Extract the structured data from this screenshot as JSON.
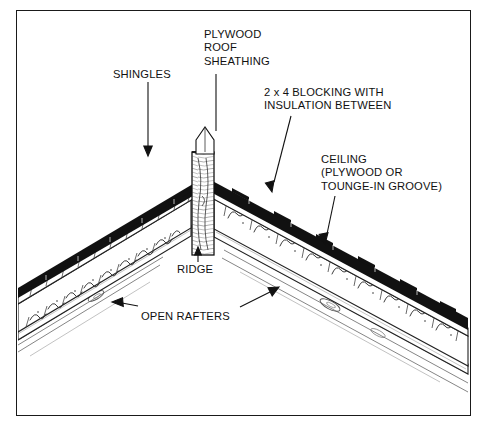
{
  "diagram": {
    "type": "architectural-cross-section",
    "background_color": "#ffffff",
    "ink_color": "#111111",
    "border": {
      "name": "diagram-frame",
      "color": "#1a1a1a",
      "x": 16,
      "y": 10,
      "width": 455,
      "height": 406
    }
  },
  "labels": [
    {
      "id": "shingles",
      "lines": [
        "SHINGLES"
      ],
      "x": 113,
      "y": 68,
      "leader": {
        "type": "vertical-arrow-down",
        "x1": 148,
        "y1": 82,
        "x2": 148,
        "y2": 152
      }
    },
    {
      "id": "plywood-roof-sheathing",
      "lines": [
        "PLYWOOD",
        "ROOF",
        "SHEATHING"
      ],
      "x": 204,
      "y": 28,
      "leader": {
        "type": "vertical-line",
        "x1": 216,
        "y1": 74,
        "x2": 216,
        "y2": 131
      }
    },
    {
      "id": "blocking-insulation",
      "lines": [
        "2 x 4 BLOCKING WITH",
        "INSULATION BETWEEN"
      ],
      "x": 264,
      "y": 86,
      "leader": {
        "type": "slanted-arrow-down-left",
        "x1": 291,
        "y1": 116,
        "x2": 272,
        "y2": 190
      }
    },
    {
      "id": "ceiling",
      "lines": [
        "CEILING",
        "(PLYWOOD OR",
        "TOUNGE-IN GROOVE)"
      ],
      "x": 321,
      "y": 153,
      "leader": {
        "type": "slanted-arrow-down-left",
        "x1": 335,
        "y1": 196,
        "x2": 325,
        "y2": 243
      }
    },
    {
      "id": "ridge",
      "lines": [
        "RIDGE"
      ],
      "x": 177,
      "y": 263,
      "leader": {
        "type": "vertical-arrow-up",
        "x1": 198,
        "y1": 262,
        "x2": 198,
        "y2": 248
      }
    },
    {
      "id": "open-rafters",
      "lines": [
        "OPEN RAFTERS"
      ],
      "x": 141,
      "y": 310,
      "leader_left": {
        "type": "arrow-left",
        "x1": 137,
        "y1": 306,
        "x2": 112,
        "y2": 302
      },
      "leader_right": {
        "type": "arrow-up-right",
        "x1": 240,
        "y1": 307,
        "x2": 277,
        "y2": 288
      }
    }
  ],
  "structure": {
    "apex": {
      "x": 205,
      "y": 127
    },
    "left_eave": {
      "x": 18,
      "y": 300
    },
    "right_eave": {
      "x": 468,
      "y": 330
    },
    "ridge_board": {
      "name": "ridge-board",
      "x": 192,
      "y": 152,
      "width": 22,
      "height": 103,
      "texture": "wood-grain"
    },
    "layers": [
      {
        "name": "shingle-course-layer",
        "color": "#111111",
        "thickness": 6
      },
      {
        "name": "plywood-sheathing-layer",
        "color": "#ffffff",
        "thickness": 5
      },
      {
        "name": "insulation-blocking-cavity",
        "color": "#ffffff",
        "thickness": 22
      },
      {
        "name": "ceiling-board-layer",
        "color": "#ffffff",
        "thickness": 9
      },
      {
        "name": "open-rafter-lines",
        "color": "#555555",
        "thickness": 14
      }
    ]
  }
}
